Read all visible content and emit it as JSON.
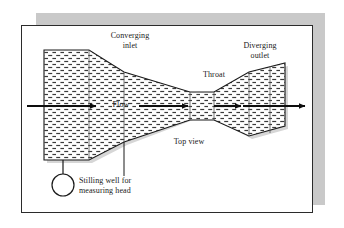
{
  "figure": {
    "labels": {
      "converging_inlet": "Converging\ninlet",
      "diverging_outlet": "Diverging\noutlet",
      "throat": "Throat",
      "flow": "Flow",
      "top_view": "Top view",
      "stilling_well": "Stilling well for\nmeasuring head"
    },
    "icons": {
      "stilling_well": "circle-icon",
      "flow_arrow_inlet": "arrow-right-icon",
      "flow_arrow_converging": "arrow-right-icon",
      "flow_arrow_throat": "arrow-right-icon",
      "flow_arrow_outlet": "arrow-right-icon"
    },
    "colors": {
      "shadow": "#c9c9c9",
      "panel_background": "#ffffff",
      "panel_border": "#2b2b2b",
      "outline": "#1a1a1a",
      "hatch": "#3a3a3a",
      "channel_shadow": "#d4d4d4",
      "text": "#1a1a1a"
    },
    "geometry": {
      "shadow_block": {
        "x": 36,
        "y": 13,
        "width": 289,
        "height": 192
      },
      "panel": {
        "x": 21,
        "y": 25,
        "width": 292,
        "height": 188
      },
      "inlet_rect": {
        "x": 44,
        "y": 50,
        "width": 45,
        "height": 110
      },
      "throat": {
        "x_start": 190,
        "x_end": 214,
        "y_top": 92,
        "y_bottom": 120
      },
      "outlet_end_x": 285,
      "stilling_well_circle": {
        "cx": 63,
        "cy": 185,
        "r": 11
      },
      "arrows": [
        {
          "name": "inlet",
          "x1": 27,
          "y1": 106,
          "x2": 98,
          "y2": 106
        },
        {
          "name": "converging",
          "x1": 139,
          "y1": 106,
          "x2": 190,
          "y2": 106
        },
        {
          "name": "throat",
          "x1": 214,
          "y1": 106,
          "x2": 243,
          "y2": 106
        },
        {
          "name": "outlet",
          "x1": 243,
          "y1": 106,
          "x2": 307,
          "y2": 106
        }
      ]
    }
  }
}
